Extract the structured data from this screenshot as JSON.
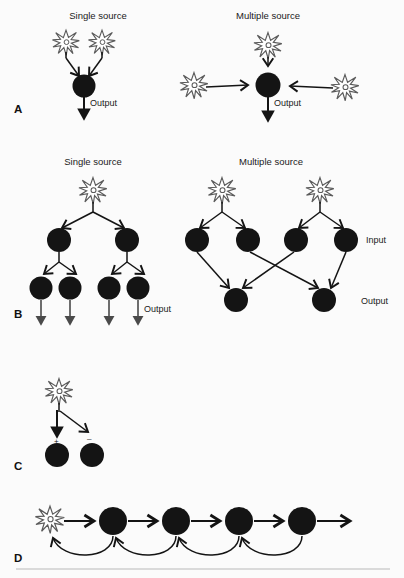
{
  "figure": {
    "background_color": "#fbfbfb",
    "ink_color": "#141414",
    "neuron_outline_color": "#5a5a5a",
    "rule_color": "#b9b9b9"
  },
  "panels": [
    {
      "letter": "A",
      "name": "divergence-convergence-single-vs-multiple",
      "subpanels": [
        {
          "heading": "Single source",
          "neuron_count": 2,
          "target_circles": 1,
          "output_label": "Output",
          "output_arrows": 1
        },
        {
          "heading": "Multiple source",
          "neuron_count": 3,
          "target_circles": 1,
          "output_label": "Output",
          "output_arrows": 1
        }
      ]
    },
    {
      "letter": "B",
      "name": "layered-networks-single-vs-multiple",
      "subpanels": [
        {
          "heading": "Single source",
          "neuron_count": 1,
          "layer1_circles": 2,
          "layer2_circles": 4,
          "output_label": "Output",
          "output_arrows": 4
        },
        {
          "heading": "Multiple source",
          "neuron_count": 2,
          "input_circles": 4,
          "output_circles": 2,
          "input_label": "Input",
          "output_label": "Output",
          "crossing": true
        }
      ]
    },
    {
      "letter": "C",
      "name": "excitation-and-inhibition",
      "neuron_count": 1,
      "target_circles": 2,
      "signs": [
        "+",
        "−"
      ]
    },
    {
      "letter": "D",
      "name": "feedforward-chain-with-feedback",
      "neuron_count": 1,
      "chain_circles": 4,
      "forward_arrows": 5,
      "feedback_arrows": 4
    }
  ],
  "labels": {
    "single_source": "Single source",
    "multiple_source": "Multiple source",
    "output": "Output",
    "input": "Input",
    "panel_a": "A",
    "panel_b": "B",
    "panel_c": "C",
    "panel_d": "D",
    "plus": "+",
    "minus": "–"
  }
}
